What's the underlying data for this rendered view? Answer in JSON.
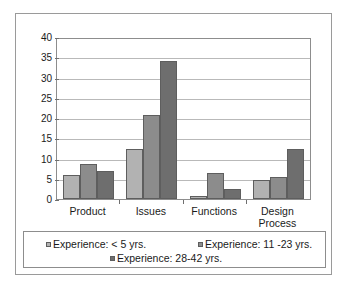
{
  "chart_data": {
    "type": "bar",
    "title": "",
    "subtitle": "",
    "xlabel": "",
    "ylabel": "",
    "ylim": [
      0,
      40
    ],
    "ytick_step": 5,
    "yticks": [
      40,
      35,
      30,
      25,
      20,
      15,
      10,
      5,
      0
    ],
    "grid": true,
    "legend_position": "bottom",
    "categories": [
      "Product",
      "Issues",
      "Functions",
      "Design Process"
    ],
    "category_lines": [
      [
        "Product"
      ],
      [
        "Issues"
      ],
      [
        "Functions"
      ],
      [
        "Design",
        "Process"
      ]
    ],
    "series": [
      {
        "name": "Experience: < 5 yrs.",
        "color": "#b2b2b2",
        "values": [
          6,
          12.5,
          0.8,
          4.7
        ]
      },
      {
        "name": "Experience: 11 -23 yrs.",
        "color": "#8c8c8c",
        "values": [
          8.7,
          21,
          6.5,
          5.4
        ]
      },
      {
        "name": "Experience: 28-42 yrs.",
        "color": "#6e6e6e",
        "values": [
          7,
          34.5,
          2.5,
          12.5
        ]
      }
    ]
  },
  "colors": {
    "series_light": "#b2b2b2",
    "series_medium": "#8c8c8c",
    "series_dark": "#6e6e6e",
    "axis": "#8d8d8d",
    "gridline": "#b9b9b9",
    "frame": "#9a9a9a",
    "text": "#1a1a1a"
  }
}
